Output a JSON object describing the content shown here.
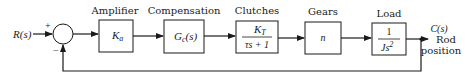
{
  "diagram": {
    "type": "block-diagram",
    "input": {
      "label": "R(s)"
    },
    "summing_junction": {
      "plus_sign": "+",
      "minus_sign": "−"
    },
    "blocks": [
      {
        "title": "Amplifier",
        "content": "Ka",
        "content_main": "K",
        "content_sub": "a"
      },
      {
        "title": "Compensation",
        "content": "Gc(s)",
        "content_main": "G",
        "content_sub": "c",
        "content_tail": "(s)"
      },
      {
        "title": "Clutches",
        "content": "KT / (τs + 1)",
        "numerator_main": "K",
        "numerator_sub": "T",
        "denominator": "τs + 1"
      },
      {
        "title": "Gears",
        "content": "n"
      },
      {
        "title": "Load",
        "content": "1 / Js²",
        "numerator": "1",
        "denominator_main": "Js",
        "denominator_sup": "2"
      }
    ],
    "output": {
      "label": "C(s)",
      "description_line1": "Rod",
      "description_line2": "position"
    },
    "feedback": "unity negative feedback"
  }
}
